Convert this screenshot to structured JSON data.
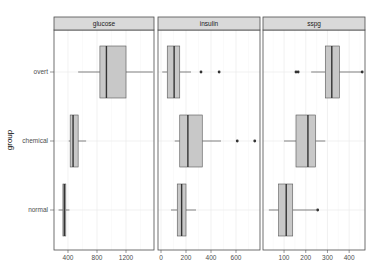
{
  "chart_data": {
    "type": "boxplot",
    "title": "",
    "xlabel": "",
    "ylabel": "group",
    "orientation": "horizontal",
    "facet_by": "variable",
    "categories": [
      "overt",
      "chemical",
      "normal"
    ],
    "grid": true,
    "legend": null,
    "style": {
      "box_fill": "#c8c8c8",
      "box_stroke": "#555555",
      "strip_fill": "#d9d9d9",
      "panel_border": "#4d4d4d",
      "grid_color": "#ebebeb"
    },
    "panels": [
      {
        "name": "glucose",
        "xlim": [
          207,
          1586
        ],
        "ticks": [
          400,
          800,
          1200
        ],
        "tick_labels": [
          "400",
          "800",
          "1200"
        ],
        "boxes": {
          "overt": {
            "whisker_low": 540,
            "q1": 840,
            "median": 930,
            "q3": 1200,
            "whisker_high": 1570,
            "outliers": []
          },
          "chemical": {
            "whisker_low": 410,
            "q1": 430,
            "median": 470,
            "q3": 540,
            "whisker_high": 650,
            "outliers": []
          },
          "normal": {
            "whisker_low": 270,
            "q1": 330,
            "median": 350,
            "q3": 370,
            "whisker_high": 420,
            "outliers": []
          }
        }
      },
      {
        "name": "insulin",
        "xlim": [
          -24,
          792
        ],
        "ticks": [
          0,
          200,
          400,
          600
        ],
        "tick_labels": [
          "0",
          "200",
          "400",
          "600"
        ],
        "boxes": {
          "overt": {
            "whisker_low": 10,
            "q1": 50,
            "median": 105,
            "q3": 150,
            "whisker_high": 240,
            "outliers": [
              320,
              465
            ]
          },
          "chemical": {
            "whisker_low": 110,
            "q1": 150,
            "median": 215,
            "q3": 330,
            "whisker_high": 480,
            "outliers": [
              610,
              750
            ]
          },
          "normal": {
            "whisker_low": 80,
            "q1": 130,
            "median": 165,
            "q3": 200,
            "whisker_high": 280,
            "outliers": []
          }
        }
      },
      {
        "name": "sspg",
        "xlim": [
          3,
          473
        ],
        "ticks": [
          100,
          200,
          300,
          400
        ],
        "tick_labels": [
          "100",
          "200",
          "300",
          "400"
        ],
        "boxes": {
          "overt": {
            "whisker_low": 225,
            "q1": 290,
            "median": 320,
            "q3": 355,
            "whisker_high": 455,
            "outliers": [
              155,
              165,
              460
            ]
          },
          "chemical": {
            "whisker_low": 100,
            "q1": 155,
            "median": 210,
            "q3": 245,
            "whisker_high": 290,
            "outliers": []
          },
          "normal": {
            "whisker_low": 30,
            "q1": 75,
            "median": 110,
            "q3": 140,
            "whisker_high": 250,
            "outliers": [
              255
            ]
          }
        }
      }
    ]
  },
  "layout": {
    "panels_px": [
      {
        "left": 54,
        "right": 154
      },
      {
        "left": 158,
        "right": 260
      },
      {
        "left": 263,
        "right": 365
      }
    ],
    "strip_top": 17,
    "strip_bottom": 30,
    "plot_bottom": 250,
    "row_y": {
      "overt": 72,
      "chemical": 141,
      "normal": 210
    },
    "box_half_height": 26
  }
}
